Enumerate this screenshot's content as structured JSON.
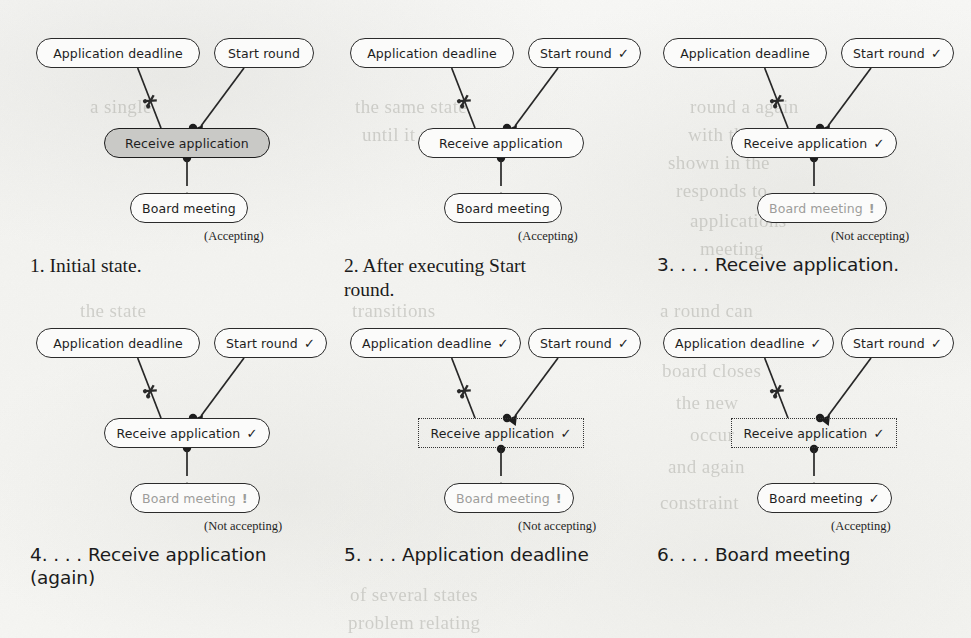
{
  "figure": {
    "node_names": {
      "application_deadline": "Application deadline",
      "start_round": "Start round",
      "receive_application": "Receive application",
      "board_meeting": "Board meeting"
    },
    "markers": {
      "check": "✓",
      "bang": "!",
      "inhibitor": "inhibitor-cut-marker"
    },
    "status": {
      "accepting": "(Accepting)",
      "not_accepting": "(Not accepting)"
    },
    "colors": {
      "ink": "#1e1e1e",
      "muted_ink": "#9d9d9a",
      "highlight_fill": "#c9c9c6",
      "paper": "#f4f4f2",
      "border": "#2b2b2b"
    },
    "panels": [
      {
        "id": "panel-1",
        "caption": "1. Initial state.",
        "caption_font": "serif",
        "status": "(Accepting)",
        "nodes": {
          "application_deadline": {
            "label": "Application deadline",
            "mark": "",
            "style": "normal"
          },
          "start_round": {
            "label": "Start round",
            "mark": "",
            "style": "normal"
          },
          "receive_application": {
            "label": "Receive application",
            "mark": "",
            "style": "highlight"
          },
          "board_meeting": {
            "label": "Board meeting",
            "mark": "",
            "style": "normal"
          }
        }
      },
      {
        "id": "panel-2",
        "caption": "2. After executing Start\nround.",
        "caption_font": "serif",
        "status": "(Accepting)",
        "nodes": {
          "application_deadline": {
            "label": "Application deadline",
            "mark": "",
            "style": "normal"
          },
          "start_round": {
            "label": "Start round",
            "mark": "✓",
            "style": "normal"
          },
          "receive_application": {
            "label": "Receive application",
            "mark": "",
            "style": "normal"
          },
          "board_meeting": {
            "label": "Board meeting",
            "mark": "",
            "style": "normal"
          }
        }
      },
      {
        "id": "panel-3",
        "caption": "3. . . . Receive application.",
        "caption_font": "sans",
        "status": "(Not accepting)",
        "nodes": {
          "application_deadline": {
            "label": "Application deadline",
            "mark": "",
            "style": "normal"
          },
          "start_round": {
            "label": "Start round",
            "mark": "✓",
            "style": "normal"
          },
          "receive_application": {
            "label": "Receive application",
            "mark": "✓",
            "style": "normal"
          },
          "board_meeting": {
            "label": "Board meeting",
            "mark": "!",
            "style": "muted"
          }
        }
      },
      {
        "id": "panel-4",
        "caption": "4. . . . Receive application\n(again)",
        "caption_font": "sans",
        "status": "(Not accepting)",
        "nodes": {
          "application_deadline": {
            "label": "Application deadline",
            "mark": "",
            "style": "normal"
          },
          "start_round": {
            "label": "Start round",
            "mark": "✓",
            "style": "normal"
          },
          "receive_application": {
            "label": "Receive application",
            "mark": "✓",
            "style": "normal"
          },
          "board_meeting": {
            "label": "Board meeting",
            "mark": "!",
            "style": "muted"
          }
        }
      },
      {
        "id": "panel-5",
        "caption": "5. . . . Application deadline",
        "caption_font": "sans",
        "status": "(Not accepting)",
        "nodes": {
          "application_deadline": {
            "label": "Application deadline",
            "mark": "✓",
            "style": "normal"
          },
          "start_round": {
            "label": "Start round",
            "mark": "✓",
            "style": "normal"
          },
          "receive_application": {
            "label": "Receive application",
            "mark": "✓",
            "style": "dotted"
          },
          "board_meeting": {
            "label": "Board meeting",
            "mark": "!",
            "style": "muted"
          }
        }
      },
      {
        "id": "panel-6",
        "caption": "6. . . . Board meeting",
        "caption_font": "sans",
        "status": "(Accepting)",
        "nodes": {
          "application_deadline": {
            "label": "Application deadline",
            "mark": "✓",
            "style": "normal"
          },
          "start_round": {
            "label": "Start round",
            "mark": "✓",
            "style": "normal"
          },
          "receive_application": {
            "label": "Receive application",
            "mark": "✓",
            "style": "dotted"
          },
          "board_meeting": {
            "label": "Board meeting",
            "mark": "✓",
            "style": "normal"
          }
        }
      }
    ],
    "ghost_text": [
      {
        "t": "the same state",
        "x": 355,
        "y": 96
      },
      {
        "t": "until it moves",
        "x": 362,
        "y": 124
      },
      {
        "t": "round a again",
        "x": 690,
        "y": 96
      },
      {
        "t": "with the round",
        "x": 688,
        "y": 124
      },
      {
        "t": "shown in the",
        "x": 668,
        "y": 152
      },
      {
        "t": "responds to",
        "x": 676,
        "y": 180
      },
      {
        "t": "applications",
        "x": 690,
        "y": 210
      },
      {
        "t": "meeting",
        "x": 700,
        "y": 238
      },
      {
        "t": "transitions",
        "x": 352,
        "y": 300
      },
      {
        "t": "a round can",
        "x": 660,
        "y": 300
      },
      {
        "t": "be fired",
        "x": 668,
        "y": 330
      },
      {
        "t": "board closes",
        "x": 662,
        "y": 360
      },
      {
        "t": "the new",
        "x": 676,
        "y": 392
      },
      {
        "t": "occur",
        "x": 690,
        "y": 424
      },
      {
        "t": "and again",
        "x": 668,
        "y": 456
      },
      {
        "t": "constraint",
        "x": 660,
        "y": 492
      },
      {
        "t": "of several states",
        "x": 350,
        "y": 584
      },
      {
        "t": "problem relating",
        "x": 348,
        "y": 612
      },
      {
        "t": "a single",
        "x": 90,
        "y": 96
      },
      {
        "t": "the state",
        "x": 80,
        "y": 300
      },
      {
        "t": "again",
        "x": 96,
        "y": 330
      }
    ]
  }
}
